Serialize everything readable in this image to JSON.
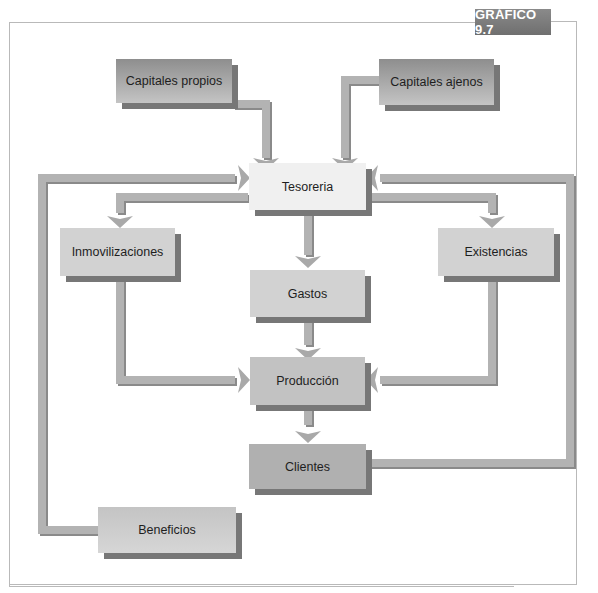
{
  "figure": {
    "label": "GRÁFICO 9.7"
  },
  "nodes": {
    "capitales_propios": "Capitales propios",
    "capitales_ajenos": "Capitales ajenos",
    "tesoreria": "Tesoreria",
    "inmovilizaciones": "Inmovilizaciones",
    "existencias": "Existencias",
    "gastos": "Gastos",
    "produccion": "Producción",
    "clientes": "Clientes",
    "beneficios": "Beneficios"
  },
  "edges": [
    {
      "from": "Capitales propios",
      "to": "Tesoreria"
    },
    {
      "from": "Capitales ajenos",
      "to": "Tesoreria"
    },
    {
      "from": "Tesoreria",
      "to": "Inmovilizaciones"
    },
    {
      "from": "Tesoreria",
      "to": "Gastos"
    },
    {
      "from": "Tesoreria",
      "to": "Existencias"
    },
    {
      "from": "Inmovilizaciones",
      "to": "Producción"
    },
    {
      "from": "Gastos",
      "to": "Producción"
    },
    {
      "from": "Existencias",
      "to": "Producción"
    },
    {
      "from": "Producción",
      "to": "Clientes"
    },
    {
      "from": "Clientes",
      "to": "Tesoreria"
    },
    {
      "from": "Beneficios",
      "to": "Tesoreria"
    }
  ],
  "colors": {
    "arrow": "#b3b3b3",
    "arrow_shadow": "#8a8a8a",
    "frame": "#b9b9b9",
    "badge": "#7a7a7a"
  }
}
